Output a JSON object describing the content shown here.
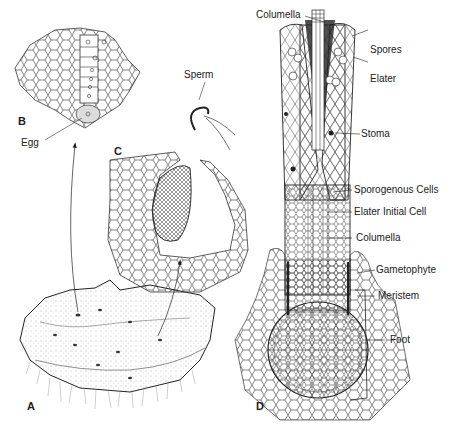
{
  "figure": {
    "panels": [
      {
        "id": "A",
        "label": "A",
        "description": "Hornwort gametophyte thallus with embedded sex organs and rhizoids"
      },
      {
        "id": "B",
        "label": "B",
        "description": "Archegonium in section showing egg"
      },
      {
        "id": "C",
        "label": "C",
        "description": "Antheridium chamber with sperm"
      },
      {
        "id": "D",
        "label": "D",
        "description": "Sporophyte longitudinal section"
      }
    ],
    "labels": {
      "egg": "Egg",
      "sperm": "Sperm",
      "columella_top": "Columella",
      "spores": "Spores",
      "elater": "Elater",
      "stoma": "Stoma",
      "sporogenous_cells": "Sporogenous Cells",
      "elater_initial_cell": "Elater Initial Cell",
      "columella": "Columella",
      "gametophyte": "Gametophyte",
      "meristem": "Meristem",
      "foot": "Foot"
    },
    "colors": {
      "ink": "#222222",
      "background": "#ffffff",
      "shade": "#d9d9d9"
    }
  }
}
